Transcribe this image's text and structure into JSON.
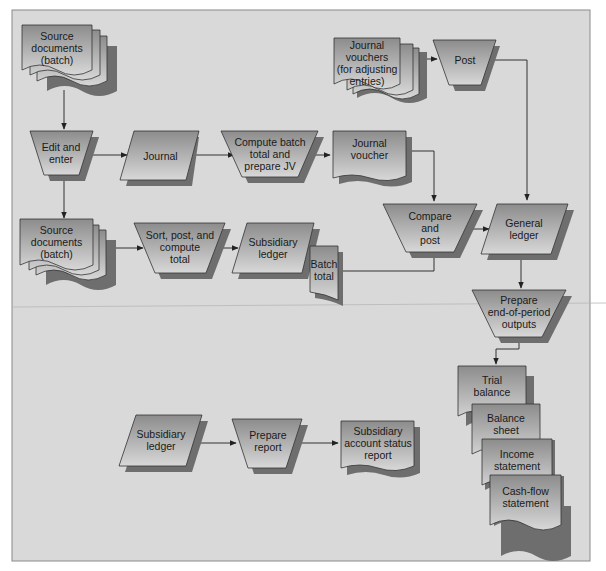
{
  "diagram": {
    "type": "accounting-system-flowchart",
    "colors": {
      "frame_fill": "#d9d9d9",
      "frame_border": "#8a8a8a",
      "shape_fill_top": "#8f8f8f",
      "shape_fill_bottom": "#d6d6d6",
      "shadow": "#6e6e6e",
      "line": "#333333"
    },
    "nodes": {
      "source_docs_1": {
        "label": "Source\ndocuments\n(batch)",
        "shape": "multi-document"
      },
      "edit_enter": {
        "label": "Edit and\nenter",
        "shape": "manual-operation"
      },
      "journal": {
        "label": "Journal",
        "shape": "data"
      },
      "compute_batch": {
        "label": "Compute batch\ntotal and\nprepare JV",
        "shape": "manual-operation"
      },
      "journal_voucher": {
        "label": "Journal\nvoucher",
        "shape": "document"
      },
      "journal_vouchers_adj": {
        "label": "Journal\nvouchers\n(for adjusting\nentries)",
        "shape": "multi-document"
      },
      "post": {
        "label": "Post",
        "shape": "manual-operation"
      },
      "source_docs_2": {
        "label": "Source\ndocuments\n(batch)",
        "shape": "multi-document"
      },
      "sort_post": {
        "label": "Sort, post, and\ncompute\ntotal",
        "shape": "manual-operation"
      },
      "subsidiary_ledger_1": {
        "label": "Subsidiary\nledger",
        "shape": "data"
      },
      "batch_total": {
        "label": "Batch\ntotal",
        "shape": "document"
      },
      "compare_post": {
        "label": "Compare\nand\npost",
        "shape": "manual-operation"
      },
      "general_ledger": {
        "label": "General\nledger",
        "shape": "data"
      },
      "prepare_outputs": {
        "label": "Prepare\nend-of-period\noutputs",
        "shape": "manual-operation"
      },
      "trial_balance": {
        "label": "Trial\nbalance",
        "shape": "document"
      },
      "balance_sheet": {
        "label": "Balance\nsheet",
        "shape": "document"
      },
      "income_statement": {
        "label": "Income\nstatement",
        "shape": "document"
      },
      "cash_flow": {
        "label": "Cash-flow\nstatement",
        "shape": "document"
      },
      "subsidiary_ledger_2": {
        "label": "Subsidiary\nledger",
        "shape": "data"
      },
      "prepare_report": {
        "label": "Prepare\nreport",
        "shape": "manual-operation"
      },
      "status_report": {
        "label": "Subsidiary\naccount status\nreport",
        "shape": "document"
      }
    },
    "edges": [
      [
        "source_docs_1",
        "edit_enter"
      ],
      [
        "edit_enter",
        "journal"
      ],
      [
        "journal",
        "compute_batch"
      ],
      [
        "compute_batch",
        "journal_voucher"
      ],
      [
        "journal_voucher",
        "compare_post"
      ],
      [
        "journal_vouchers_adj",
        "post"
      ],
      [
        "post",
        "general_ledger"
      ],
      [
        "edit_enter",
        "source_docs_2"
      ],
      [
        "source_docs_2",
        "sort_post"
      ],
      [
        "sort_post",
        "subsidiary_ledger_1"
      ],
      [
        "batch_total",
        "compare_post"
      ],
      [
        "compare_post",
        "general_ledger"
      ],
      [
        "general_ledger",
        "prepare_outputs"
      ],
      [
        "prepare_outputs",
        "trial_balance"
      ],
      [
        "subsidiary_ledger_2",
        "prepare_report"
      ],
      [
        "prepare_report",
        "status_report"
      ]
    ]
  }
}
